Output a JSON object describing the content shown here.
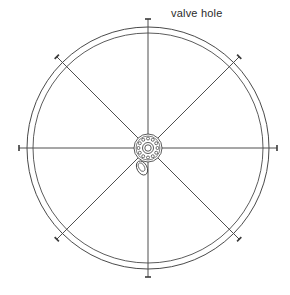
{
  "drawing": {
    "title": "Wheel rim plan view",
    "annotations": [
      {
        "id": "valve-hole",
        "text": "valve hole",
        "x": 171,
        "y": 7
      }
    ],
    "colors": {
      "line": "#3a3a3a",
      "rim": "#4a4a4a",
      "hub": "#333333",
      "background": "#ffffff",
      "text": "#2b2b2b"
    },
    "geometry": {
      "center_x": 148,
      "center_y": 148,
      "rim_outer_radius": 121,
      "rim_inner_radius": 115,
      "hub_flange_radius": 14,
      "hub_bolt_circle_radius": 9.5,
      "hub_bolt_hole_radius": 1.5,
      "hub_bore_outer_radius": 5.5,
      "hub_bore_inner_radius": 3.2,
      "hub_bolt_count": 12,
      "spoke_count": 8,
      "spoke_angles_deg": [
        0,
        45,
        90,
        135,
        180,
        225,
        270,
        315
      ],
      "spoke_tip_radius": 129,
      "tick_length": 6,
      "valve_hole": {
        "cx": 142,
        "cy": 168,
        "rx": 5.0,
        "ry": 7.5,
        "rotation_deg": -28
      }
    },
    "stroke_widths": {
      "rim_outer": 1.0,
      "rim_inner": 0.9,
      "spoke": 0.9,
      "hub": 0.8,
      "tick": 1.6
    }
  }
}
